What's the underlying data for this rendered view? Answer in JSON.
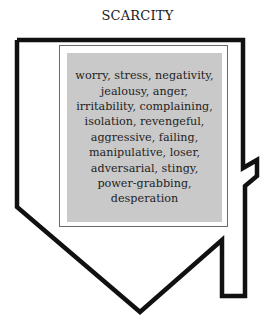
{
  "diagram": {
    "title": "SCARCITY",
    "shape": "downward-arrow",
    "items_text": "worry, stress, negativity, jealousy, anger, irritability, complaining, isolation, revengeful, aggressive, failing, manipulative, loser, adversarial, stingy, power-grabbing, desperation",
    "lines": [
      "worry, stress, negativity,",
      "jealousy, anger,",
      "irritability, complaining,",
      "isolation, revengeful,",
      "aggressive, failing,",
      "manipulative, loser,",
      "adversarial, stingy,",
      "power-grabbing,",
      "desperation"
    ],
    "colors": {
      "outline": "#111111",
      "box_fill": "#c9c9c9",
      "frame_border": "#6a6a6a",
      "background": "#ffffff"
    }
  }
}
